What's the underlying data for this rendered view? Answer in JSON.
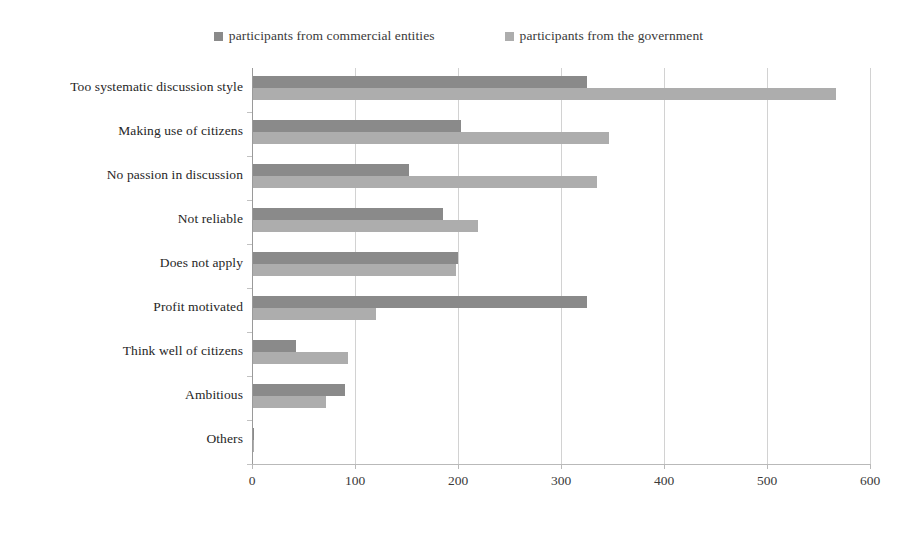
{
  "chart_data": {
    "type": "bar",
    "orientation": "horizontal",
    "title": "",
    "subtitle": "",
    "xlabel": "",
    "ylabel": "",
    "xlim": [
      0,
      600
    ],
    "xticks": [
      0,
      100,
      200,
      300,
      400,
      500,
      600
    ],
    "xtick_labels": [
      "0",
      "100",
      "200",
      "300",
      "400",
      "500",
      "600"
    ],
    "grid": true,
    "grid_axis": "x",
    "legend_position": "top-center",
    "categories": [
      "Too systematic discussion style",
      "Making use of citizens",
      "No passion in discussion",
      "Not reliable",
      "Does not apply",
      "Profit motivated",
      "Think well of citizens",
      "Ambitious",
      "Others"
    ],
    "series": [
      {
        "name": "participants from commercial entities",
        "color": "#8a8a8a",
        "values": [
          325,
          203,
          152,
          185,
          200,
          325,
          43,
          90,
          2
        ]
      },
      {
        "name": "participants from the government",
        "color": "#adadad",
        "values": [
          567,
          347,
          335,
          219,
          198,
          120,
          93,
          72,
          2
        ]
      }
    ]
  },
  "legend": {
    "entries": [
      {
        "label": "participants from commercial entities",
        "swatch": "#8a8a8a"
      },
      {
        "label": "participants from the government",
        "swatch": "#adadad"
      }
    ]
  },
  "colors": {
    "series_primary": "#8a8a8a",
    "series_secondary": "#adadad",
    "gridline": "#d2d2d2",
    "axis": "#9a9a9a",
    "text": "#262626",
    "background": "#ffffff"
  }
}
